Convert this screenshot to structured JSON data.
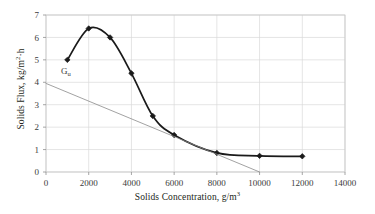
{
  "chart_data": {
    "type": "line",
    "title": "",
    "xlabel": "Solids Concentration, g/m",
    "xlabel_sup": "3",
    "ylabel_part1": "Solids Flux, kg/m",
    "ylabel_sup": "2",
    "ylabel_part2": "·h",
    "xlim": [
      0,
      14000
    ],
    "ylim": [
      0,
      7
    ],
    "xticks": [
      0,
      2000,
      4000,
      6000,
      8000,
      10000,
      12000,
      14000
    ],
    "xticklabels": [
      "0",
      "2000",
      "4000",
      "6000",
      "8000",
      "10000",
      "12000",
      "14000"
    ],
    "yticks": [
      0,
      1,
      2,
      3,
      4,
      5,
      6,
      7
    ],
    "yticklabels": [
      "0",
      "1",
      "2",
      "3",
      "4",
      "5",
      "6",
      "7"
    ],
    "grid": true,
    "grid_color": "#d9d9d9",
    "legend": null,
    "series": [
      {
        "name": "Solids flux curve",
        "type": "line",
        "marker": "filled-diamond",
        "color": "#1a1a1a",
        "linewidth": 1.7,
        "smooth": true,
        "x": [
          1000,
          2000,
          3000,
          4000,
          5000,
          6000,
          8000,
          10000,
          12000
        ],
        "values": [
          5.0,
          6.4,
          6.0,
          4.4,
          2.5,
          1.65,
          0.85,
          0.72,
          0.7
        ]
      },
      {
        "name": "Underflow flux line",
        "type": "line",
        "marker": "none",
        "color": "#8a8a8a",
        "linewidth": 0.8,
        "smooth": false,
        "x": [
          0,
          10000
        ],
        "values": [
          3.95,
          0.0
        ]
      }
    ],
    "annotations": [
      {
        "name": "underflow-flux-label",
        "text": "G",
        "subscript": "u",
        "x": 700,
        "y": 4.38
      }
    ]
  }
}
